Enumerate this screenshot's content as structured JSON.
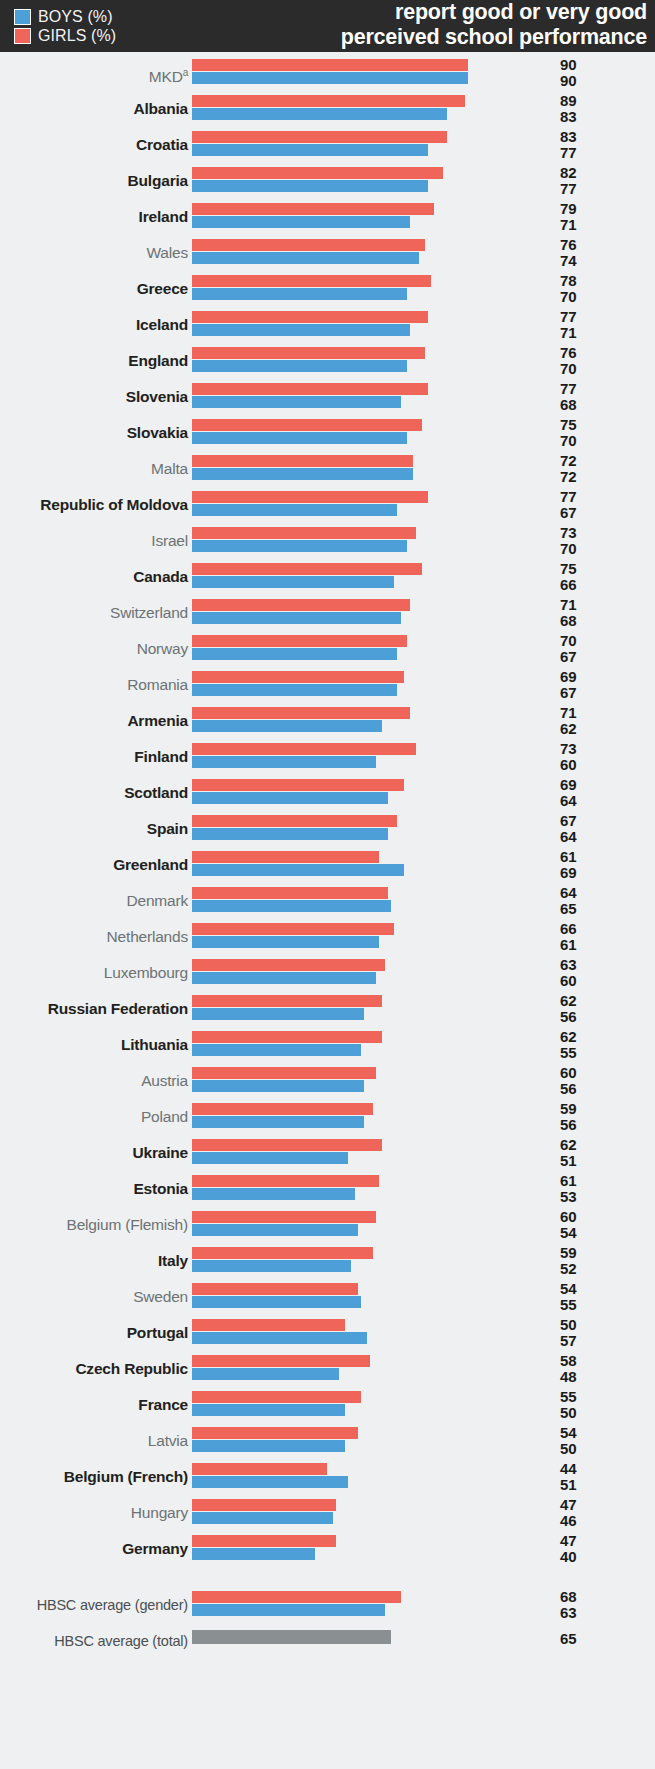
{
  "header": {
    "title_line1": "report good or very good",
    "title_line2": "perceived school performance",
    "legend": [
      {
        "label": "BOYS (%)",
        "color": "#4d9fd8",
        "key": "boys"
      },
      {
        "label": "GIRLS (%)",
        "color": "#f0655a",
        "key": "girls"
      }
    ]
  },
  "chart_data": {
    "type": "bar",
    "title": "report good or very good perceived school performance",
    "orientation": "horizontal",
    "xlabel": "",
    "ylabel": "",
    "xlim": [
      0,
      90
    ],
    "grid": false,
    "legend_position": "top-left",
    "categories": [
      "MKDᵃ",
      "Albania",
      "Croatia",
      "Bulgaria",
      "Ireland",
      "Wales",
      "Greece",
      "Iceland",
      "England",
      "Slovenia",
      "Slovakia",
      "Malta",
      "Republic of Moldova",
      "Israel",
      "Canada",
      "Switzerland",
      "Norway",
      "Romania",
      "Armenia",
      "Finland",
      "Scotland",
      "Spain",
      "Greenland",
      "Denmark",
      "Netherlands",
      "Luxembourg",
      "Russian Federation",
      "Lithuania",
      "Austria",
      "Poland",
      "Ukraine",
      "Estonia",
      "Belgium (Flemish)",
      "Italy",
      "Sweden",
      "Portugal",
      "Czech Republic",
      "France",
      "Latvia",
      "Belgium (French)",
      "Hungary",
      "Germany"
    ],
    "series": [
      {
        "name": "GIRLS (%)",
        "color": "#f0655a",
        "values": [
          90,
          89,
          83,
          82,
          79,
          76,
          78,
          77,
          76,
          77,
          75,
          72,
          77,
          73,
          75,
          71,
          70,
          69,
          71,
          73,
          69,
          67,
          61,
          64,
          66,
          63,
          62,
          62,
          60,
          59,
          62,
          61,
          60,
          59,
          54,
          50,
          58,
          55,
          54,
          44,
          47,
          47
        ]
      },
      {
        "name": "BOYS (%)",
        "color": "#4d9fd8",
        "values": [
          90,
          83,
          77,
          77,
          71,
          74,
          70,
          71,
          70,
          68,
          70,
          72,
          67,
          70,
          66,
          68,
          67,
          67,
          62,
          60,
          64,
          64,
          69,
          65,
          61,
          60,
          56,
          55,
          56,
          56,
          51,
          53,
          54,
          52,
          55,
          57,
          48,
          50,
          50,
          51,
          46,
          40
        ]
      }
    ],
    "significant_difference": [
      false,
      true,
      true,
      true,
      true,
      false,
      true,
      true,
      true,
      true,
      true,
      false,
      true,
      false,
      true,
      false,
      false,
      false,
      true,
      true,
      true,
      true,
      true,
      false,
      false,
      false,
      true,
      true,
      false,
      false,
      true,
      true,
      false,
      true,
      false,
      true,
      true,
      true,
      false,
      true,
      false,
      true
    ],
    "averages": [
      {
        "label": "HBSC average (gender)",
        "type": "gender",
        "girls": 68,
        "boys": 63
      },
      {
        "label": "HBSC average (total)",
        "type": "total",
        "color": "#8a8f92",
        "total": 65
      }
    ]
  }
}
